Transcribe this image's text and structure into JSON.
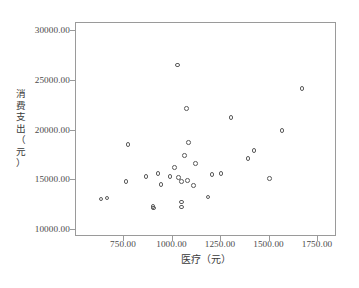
{
  "chart_data": {
    "type": "scatter",
    "title": "",
    "xlabel": "医疗（元）",
    "ylabel": "消费支出（元）",
    "xlim": [
      560,
      1905
    ],
    "ylim": [
      8600,
      30800
    ],
    "grid": false,
    "legend": null,
    "xticks": [
      "750.00",
      "1000.00",
      "1250.00",
      "1500.00",
      "1750.00"
    ],
    "xtick_values": [
      750,
      1000,
      1250,
      1500,
      1750
    ],
    "yticks": [
      "10000.00",
      "15000.00",
      "20000.00",
      "25000.00",
      "30000.00"
    ],
    "ytick_values": [
      10000,
      15000,
      20000,
      25000,
      30000
    ],
    "marker": "open-circle",
    "marker_color": "#5b5b5b",
    "points": [
      {
        "x": 632,
        "y": 13100
      },
      {
        "x": 663,
        "y": 13200
      },
      {
        "x": 760,
        "y": 14900
      },
      {
        "x": 771,
        "y": 18600
      },
      {
        "x": 863,
        "y": 15400
      },
      {
        "x": 900,
        "y": 12350
      },
      {
        "x": 903,
        "y": 12200
      },
      {
        "x": 926,
        "y": 15700
      },
      {
        "x": 941,
        "y": 14600
      },
      {
        "x": 988,
        "y": 15400
      },
      {
        "x": 1011,
        "y": 16300
      },
      {
        "x": 1026,
        "y": 26600
      },
      {
        "x": 1031,
        "y": 15300
      },
      {
        "x": 1047,
        "y": 14900
      },
      {
        "x": 1047,
        "y": 12800
      },
      {
        "x": 1047,
        "y": 12300
      },
      {
        "x": 1062,
        "y": 17500
      },
      {
        "x": 1072,
        "y": 22200
      },
      {
        "x": 1078,
        "y": 15000
      },
      {
        "x": 1083,
        "y": 18800
      },
      {
        "x": 1108,
        "y": 14500
      },
      {
        "x": 1119,
        "y": 16700
      },
      {
        "x": 1183,
        "y": 13300
      },
      {
        "x": 1204,
        "y": 15600
      },
      {
        "x": 1249,
        "y": 15700
      },
      {
        "x": 1302,
        "y": 21300
      },
      {
        "x": 1389,
        "y": 17200
      },
      {
        "x": 1420,
        "y": 18000
      },
      {
        "x": 1500,
        "y": 15200
      },
      {
        "x": 1565,
        "y": 20000
      },
      {
        "x": 1668,
        "y": 24200
      }
    ]
  },
  "axes": {
    "y_title_chars": [
      "消",
      "费",
      "支",
      "出",
      "（",
      "元",
      "）"
    ]
  },
  "footer": {
    "caption": ""
  }
}
